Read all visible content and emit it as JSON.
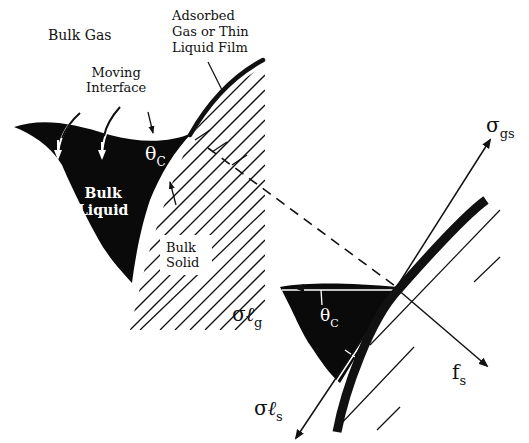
{
  "diagram": {
    "labels": {
      "bulk_gas": "Bulk Gas",
      "adsorbed": [
        "Adsorbed",
        "Gas or Thin",
        "Liquid Film"
      ],
      "moving_interface": [
        "Moving",
        "Interface"
      ],
      "bulk_liquid": [
        "Bulk",
        "Liquid"
      ],
      "bulk_solid": [
        "Bulk",
        "Solid"
      ],
      "theta_c_main": {
        "symbol": "θ",
        "sub": "C"
      },
      "theta_c_inset": {
        "symbol": "θ",
        "sub": "C"
      },
      "sigma_gs": {
        "symbol": "σ",
        "sub": "gs"
      },
      "sigma_lg": {
        "symbol": "σ",
        "ell": "ℓ",
        "sub": "g"
      },
      "sigma_ls": {
        "symbol": "σ",
        "ell": "ℓ",
        "sub": "s"
      },
      "f_s": {
        "symbol": "f",
        "sub": "s"
      }
    },
    "colors": {
      "ink": "#111111",
      "background": "#ffffff",
      "liquid_fill": "#0a0a0a"
    }
  }
}
